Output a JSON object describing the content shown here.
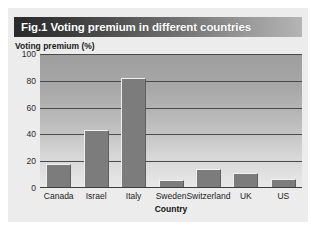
{
  "figure": {
    "title": "Fig.1 Voting premium in different countries",
    "title_bar_gradient_from": "#2a2a2a",
    "title_bar_gradient_to": "#b4b4b4",
    "card_background": "#ececec",
    "page_background": "#ffffff"
  },
  "chart_data": {
    "type": "bar",
    "title": "Fig.1 Voting premium in different countries",
    "xlabel": "Country",
    "ylabel": "Voting premium (%)",
    "categories": [
      "Canada",
      "Israel",
      "Italy",
      "Sweden",
      "Switzerland",
      "UK",
      "US"
    ],
    "values": [
      18,
      43,
      82,
      6,
      14,
      11,
      7
    ],
    "ylim": [
      0,
      100
    ],
    "yticks": [
      0,
      20,
      40,
      60,
      80,
      100
    ],
    "ytick_labels": [
      "0",
      "20",
      "40",
      "60",
      "80",
      "100"
    ],
    "grid": true,
    "grid_axis": "y",
    "grid_color": "#4a4a4a",
    "legend": false,
    "bar_color": "#7c7c7c",
    "plot_background_top": "#9e9e9e",
    "plot_background_bottom": "#e9e9e9"
  }
}
